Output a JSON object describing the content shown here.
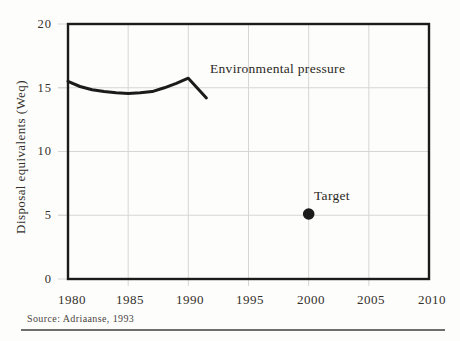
{
  "caption": {
    "source": "Source: Adriaanse, 1993"
  },
  "colors": {
    "ink": "#1b1b1b",
    "grid": "#d6d6d6",
    "text": "#2e2a26",
    "rule": "#6e6e6e",
    "background": "#fdfdfb"
  },
  "chart_data": {
    "type": "line",
    "title": "",
    "xlabel": "",
    "ylabel": "Disposal equivalents (Weq)",
    "xlim": [
      1980,
      2010
    ],
    "ylim": [
      0,
      20
    ],
    "x_ticks": [
      1980,
      1985,
      1990,
      1995,
      2000,
      2005,
      2010
    ],
    "y_ticks": [
      0,
      5,
      10,
      15,
      20
    ],
    "x_tick_labels": [
      "1980",
      "1985",
      "1990",
      "1995",
      "2000",
      "2005",
      "2010"
    ],
    "y_tick_labels_top_to_bottom": [
      "20",
      "15",
      "10",
      "5",
      "0"
    ],
    "grid": {
      "vertical_years": [
        1985,
        1990,
        1995,
        2000,
        2005
      ],
      "horizontal_values": [
        5,
        10,
        15
      ],
      "style": "light-gray, ticks extend slightly outside frame"
    },
    "legend_position": "inline-annotations",
    "series": [
      {
        "name": "Environmental pressure",
        "type": "line",
        "points": [
          [
            1980,
            15.5
          ],
          [
            1981,
            15.1
          ],
          [
            1982,
            14.85
          ],
          [
            1983,
            14.7
          ],
          [
            1984,
            14.6
          ],
          [
            1985,
            14.55
          ],
          [
            1986,
            14.6
          ],
          [
            1987,
            14.7
          ],
          [
            1988,
            15.0
          ],
          [
            1989,
            15.35
          ],
          [
            1990,
            15.75
          ],
          [
            1991.5,
            14.2
          ]
        ]
      },
      {
        "name": "Target",
        "type": "point",
        "points": [
          [
            2000,
            5.1
          ]
        ]
      }
    ],
    "annotations": [
      {
        "text": "Environmental pressure",
        "near": "end of line, year 1992, value 16"
      },
      {
        "text": "Target",
        "near": "above-right of target dot at (2000, 5.1)"
      }
    ]
  }
}
